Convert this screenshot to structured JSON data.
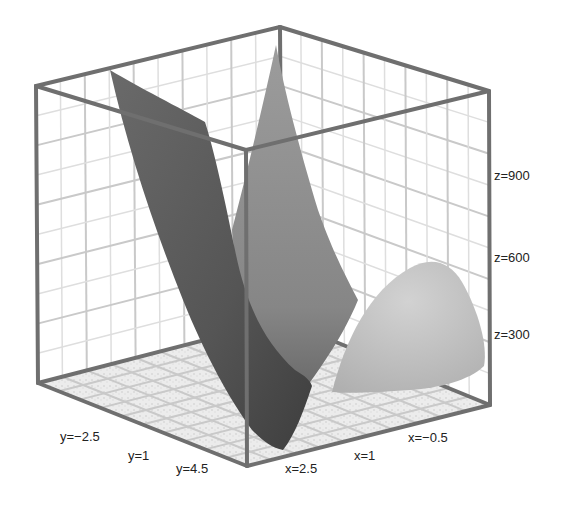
{
  "chart_data": {
    "type": "surface3d",
    "title": "",
    "axes": {
      "x": {
        "ticks": [
          2.5,
          1,
          -0.5
        ],
        "tick_labels": [
          "x=2.5",
          "x=1",
          "x=−0.5"
        ],
        "range": [
          -1.25,
          3.25
        ]
      },
      "y": {
        "ticks": [
          -2.5,
          1,
          4.5
        ],
        "tick_labels": [
          "y=−2.5",
          "y=1",
          "y=4.5"
        ],
        "range": [
          -4,
          6
        ]
      },
      "z": {
        "ticks": [
          300,
          600,
          900
        ],
        "tick_labels": [
          "z=300",
          "z=600",
          "z=900"
        ],
        "range": [
          0,
          1200
        ]
      }
    },
    "grid": true,
    "box": true,
    "surfaces": [
      {
        "name": "steep-parabolic-sheet",
        "shade": "dark",
        "color": "#5a5a5a",
        "description": "parabolic sheet rising steeply toward y=-2.5 side, min near x=2.5,y=4.5"
      },
      {
        "name": "central-peak-sheet",
        "shade": "medium",
        "color": "#8e8e8e",
        "description": "sheet rising to a sharp ridge toward back corner, reaching above z=1200"
      },
      {
        "name": "dome-surface",
        "shade": "light",
        "color": "#bdbdbd",
        "description": "rounded bump near x=-0.5, peaking near z=550"
      }
    ],
    "colors": {
      "box": "#6f6f6f",
      "grid": "#c9c9c9",
      "background": "#ffffff"
    }
  }
}
